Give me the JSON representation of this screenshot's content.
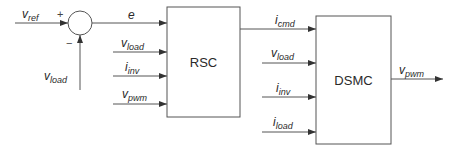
{
  "diagram": {
    "summing_junction": {
      "plus_sign": "+",
      "minus_sign": "−"
    },
    "signals": {
      "v_ref": {
        "base": "v",
        "sub": "ref"
      },
      "v_load_feedback": {
        "base": "v",
        "sub": "load"
      },
      "e": {
        "base": "e",
        "sub": ""
      },
      "rsc_in_v_load": {
        "base": "v",
        "sub": "load"
      },
      "rsc_in_i_inv": {
        "base": "i",
        "sub": "inv"
      },
      "rsc_in_v_pwm": {
        "base": "v",
        "sub": "pwm"
      },
      "i_cmd": {
        "base": "i",
        "sub": "cmd"
      },
      "dsmc_in_v_load": {
        "base": "v",
        "sub": "load"
      },
      "dsmc_in_i_inv": {
        "base": "i",
        "sub": "inv"
      },
      "dsmc_in_i_load": {
        "base": "i",
        "sub": "load"
      },
      "v_pwm_out": {
        "base": "v",
        "sub": "pwm"
      }
    },
    "blocks": {
      "rsc": {
        "label": "RSC"
      },
      "dsmc": {
        "label": "DSMC"
      }
    },
    "colors": {
      "line": "#555555",
      "text": "#2a2a2a",
      "background": "#ffffff"
    }
  }
}
